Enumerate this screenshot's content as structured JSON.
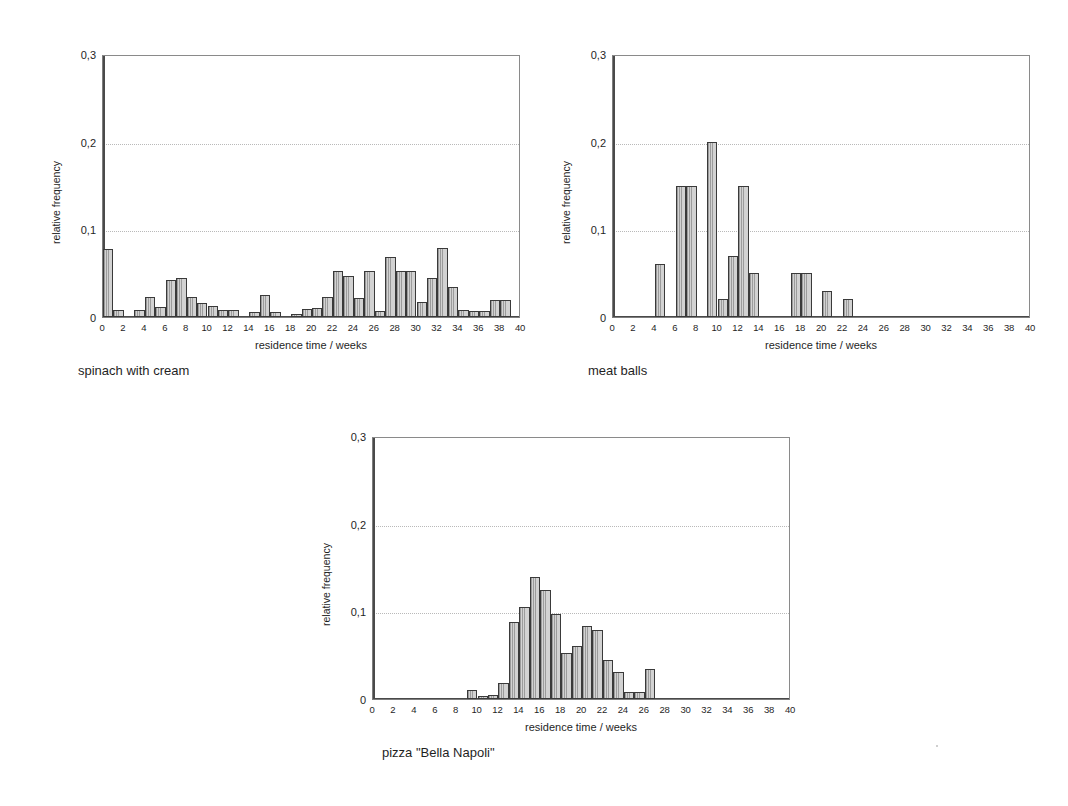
{
  "page": {
    "width": 1068,
    "height": 806,
    "background": "#ffffff",
    "ink": "#1f1f1f",
    "bar_fill": "#d2d2d2",
    "bar_outline": "#3a3a3a",
    "grid_color": "#b9b9b9"
  },
  "common": {
    "xlabel": "residence time / weeks",
    "ylabel": "relative frequency",
    "yticks": [
      "0",
      "0,1",
      "0,2",
      "0,3"
    ],
    "ytick_values": [
      0,
      0.1,
      0.2,
      0.3
    ],
    "xticks": [
      "0",
      "2",
      "4",
      "6",
      "8",
      "10",
      "12",
      "14",
      "16",
      "18",
      "20",
      "22",
      "24",
      "26",
      "28",
      "30",
      "32",
      "34",
      "36",
      "38",
      "40"
    ],
    "xtick_values": [
      0,
      2,
      4,
      6,
      8,
      10,
      12,
      14,
      16,
      18,
      20,
      22,
      24,
      26,
      28,
      30,
      32,
      34,
      36,
      38,
      40
    ],
    "gridlines": [
      0.1,
      0.2
    ],
    "xlim": [
      0,
      40
    ],
    "ylim": [
      0,
      0.3
    ]
  },
  "chart_data": [
    {
      "id": "spinach",
      "type": "bar",
      "title": "spinach with cream",
      "caption": "spinach with cream",
      "xlabel": "residence time / weeks",
      "ylabel": "relative frequency",
      "xlim": [
        0,
        40
      ],
      "ylim": [
        0,
        0.3
      ],
      "yticks": [
        0,
        0.1,
        0.2,
        0.3
      ],
      "ytick_labels": [
        "0",
        "0,1",
        "0,2",
        "0,3"
      ],
      "xticks": [
        0,
        2,
        4,
        6,
        8,
        10,
        12,
        14,
        16,
        18,
        20,
        22,
        24,
        26,
        28,
        30,
        32,
        34,
        36,
        38,
        40
      ],
      "grid": "horizontal-dotted",
      "legend": "none",
      "bin_width": 1,
      "categories": [
        0,
        1,
        2,
        3,
        4,
        5,
        6,
        7,
        8,
        9,
        10,
        11,
        12,
        13,
        14,
        15,
        16,
        17,
        18,
        19,
        20,
        21,
        22,
        23,
        24,
        25,
        26,
        27,
        28,
        29,
        30,
        31,
        32,
        33,
        34,
        35,
        36,
        37,
        38,
        39
      ],
      "values": [
        0.078,
        0.008,
        0.0,
        0.008,
        0.023,
        0.011,
        0.042,
        0.045,
        0.023,
        0.016,
        0.012,
        0.008,
        0.008,
        0.0,
        0.006,
        0.025,
        0.006,
        0.0,
        0.003,
        0.009,
        0.01,
        0.023,
        0.053,
        0.047,
        0.022,
        0.053,
        0.007,
        0.068,
        0.053,
        0.053,
        0.017,
        0.045,
        0.079,
        0.034,
        0.008,
        0.007,
        0.007,
        0.019,
        0.019,
        0.0
      ]
    },
    {
      "id": "meatballs",
      "type": "bar",
      "title": "meat balls",
      "caption": "meat balls",
      "xlabel": "residence time / weeks",
      "ylabel": "relative frequency",
      "xlim": [
        0,
        40
      ],
      "ylim": [
        0,
        0.3
      ],
      "yticks": [
        0,
        0.1,
        0.2,
        0.3
      ],
      "ytick_labels": [
        "0",
        "0,1",
        "0,2",
        "0,3"
      ],
      "xticks": [
        0,
        2,
        4,
        6,
        8,
        10,
        12,
        14,
        16,
        18,
        20,
        22,
        24,
        26,
        28,
        30,
        32,
        34,
        36,
        38,
        40
      ],
      "grid": "horizontal-dotted",
      "legend": "none",
      "bin_width": 1,
      "categories": [
        0,
        1,
        2,
        3,
        4,
        5,
        6,
        7,
        8,
        9,
        10,
        11,
        12,
        13,
        14,
        15,
        16,
        17,
        18,
        19,
        20,
        21,
        22,
        23,
        24,
        25,
        26,
        27,
        28,
        29,
        30,
        31,
        32,
        33,
        34,
        35,
        36,
        37,
        38,
        39
      ],
      "values": [
        0,
        0,
        0,
        0,
        0.06,
        0,
        0.15,
        0.15,
        0,
        0.2,
        0.02,
        0.07,
        0.15,
        0.05,
        0,
        0,
        0,
        0.05,
        0.05,
        0,
        0.03,
        0,
        0.02,
        0,
        0,
        0,
        0,
        0,
        0,
        0,
        0,
        0,
        0,
        0,
        0,
        0,
        0,
        0,
        0,
        0
      ]
    },
    {
      "id": "pizza",
      "type": "bar",
      "title": "pizza \"Bella Napoli\"",
      "caption": "pizza \"Bella Napoli\"",
      "xlabel": "residence time / weeks",
      "ylabel": "relative frequency",
      "xlim": [
        0,
        40
      ],
      "ylim": [
        0,
        0.3
      ],
      "yticks": [
        0,
        0.1,
        0.2,
        0.3
      ],
      "ytick_labels": [
        "0",
        "0,1",
        "0,2",
        "0,3"
      ],
      "xticks": [
        0,
        2,
        4,
        6,
        8,
        10,
        12,
        14,
        16,
        18,
        20,
        22,
        24,
        26,
        28,
        30,
        32,
        34,
        36,
        38,
        40
      ],
      "grid": "horizontal-dotted",
      "legend": "none",
      "bin_width": 1,
      "categories": [
        0,
        1,
        2,
        3,
        4,
        5,
        6,
        7,
        8,
        9,
        10,
        11,
        12,
        13,
        14,
        15,
        16,
        17,
        18,
        19,
        20,
        21,
        22,
        23,
        24,
        25,
        26,
        27,
        28,
        29,
        30,
        31,
        32,
        33,
        34,
        35,
        36,
        37,
        38,
        39
      ],
      "values": [
        0,
        0,
        0,
        0,
        0,
        0,
        0,
        0,
        0,
        0.01,
        0.004,
        0.005,
        0.018,
        0.088,
        0.105,
        0.139,
        0.124,
        0.097,
        0.052,
        0.06,
        0.083,
        0.079,
        0.044,
        0.031,
        0.008,
        0.008,
        0.034,
        0,
        0,
        0,
        0,
        0,
        0,
        0,
        0,
        0,
        0,
        0,
        0,
        0
      ]
    }
  ],
  "layout": {
    "charts": [
      {
        "id": "spinach",
        "plot_left": 102,
        "plot_top": 55,
        "plot_width": 418,
        "plot_height": 263,
        "caption_left": 78,
        "caption_top": 363
      },
      {
        "id": "meatballs",
        "plot_left": 612,
        "plot_top": 55,
        "plot_width": 418,
        "plot_height": 263,
        "caption_left": 588,
        "caption_top": 363
      },
      {
        "id": "pizza",
        "plot_left": 372,
        "plot_top": 437,
        "plot_width": 418,
        "plot_height": 263,
        "caption_left": 382,
        "caption_top": 745
      }
    ]
  }
}
